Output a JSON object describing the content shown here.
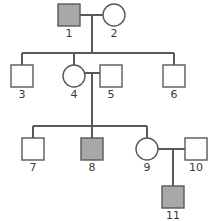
{
  "chart_data": {
    "type": "diagram",
    "diagram_kind": "pedigree-chart",
    "title": "",
    "generations": 3,
    "colors": {
      "stroke": "#595959",
      "affected_fill": "#a8a8a8",
      "unaffected_fill": "#ffffff",
      "background": "#ffffff",
      "label_color": "#3a3a3a"
    },
    "legend": {
      "square": "male",
      "circle": "female",
      "filled": "affected",
      "open": "unaffected"
    },
    "stroke_width": 1.4,
    "symbol_size": 22,
    "individuals": [
      {
        "id": "1",
        "label": "1",
        "sex": "male",
        "shape": "square",
        "affected": true,
        "generation": 1,
        "x": 69,
        "y": 15,
        "label_x": 69,
        "label_y": 37
      },
      {
        "id": "2",
        "label": "2",
        "sex": "female",
        "shape": "circle",
        "affected": false,
        "generation": 1,
        "x": 114,
        "y": 15,
        "label_x": 114,
        "label_y": 37
      },
      {
        "id": "3",
        "label": "3",
        "sex": "male",
        "shape": "square",
        "affected": false,
        "generation": 2,
        "x": 22,
        "y": 76,
        "label_x": 22,
        "label_y": 98
      },
      {
        "id": "4",
        "label": "4",
        "sex": "female",
        "shape": "circle",
        "affected": false,
        "generation": 2,
        "x": 74,
        "y": 76,
        "label_x": 74,
        "label_y": 98
      },
      {
        "id": "5",
        "label": "5",
        "sex": "male",
        "shape": "square",
        "affected": false,
        "generation": 2,
        "x": 111,
        "y": 76,
        "label_x": 111,
        "label_y": 98
      },
      {
        "id": "6",
        "label": "6",
        "sex": "male",
        "shape": "square",
        "affected": false,
        "generation": 2,
        "x": 174,
        "y": 76,
        "label_x": 174,
        "label_y": 98
      },
      {
        "id": "7",
        "label": "7",
        "sex": "male",
        "shape": "square",
        "affected": false,
        "generation": 3,
        "x": 33,
        "y": 149,
        "label_x": 33,
        "label_y": 171
      },
      {
        "id": "8",
        "label": "8",
        "sex": "male",
        "shape": "square",
        "affected": true,
        "generation": 3,
        "x": 92,
        "y": 149,
        "label_x": 92,
        "label_y": 171
      },
      {
        "id": "9",
        "label": "9",
        "sex": "female",
        "shape": "circle",
        "affected": false,
        "generation": 3,
        "x": 147,
        "y": 149,
        "label_x": 147,
        "label_y": 171
      },
      {
        "id": "10",
        "label": "10",
        "sex": "male",
        "shape": "square",
        "affected": false,
        "generation": 3,
        "x": 196,
        "y": 149,
        "label_x": 196,
        "label_y": 171
      },
      {
        "id": "11",
        "label": "11",
        "sex": "male",
        "shape": "square",
        "affected": true,
        "generation": 4,
        "x": 173,
        "y": 197,
        "label_x": 173,
        "label_y": 219
      }
    ],
    "matings": [
      {
        "id": "mating-1-2",
        "partners": [
          "1",
          "2"
        ],
        "line_y": 15,
        "x1": 80,
        "x2": 103,
        "drop_x": 92,
        "drop_from": 15,
        "drop_to": 53
      },
      {
        "id": "mating-4-5",
        "partners": [
          "4",
          "5"
        ],
        "line_y": 73,
        "x1": 85,
        "x2": 100,
        "drop_x": 92,
        "drop_to": 126,
        "drop_from": 73
      },
      {
        "id": "mating-9-10",
        "partners": [
          "9",
          "10"
        ],
        "line_y": 149,
        "x1": 158,
        "x2": 185,
        "drop_x": 173,
        "drop_from": 149,
        "drop_to": 186
      }
    ],
    "sibships": [
      {
        "id": "sibship-gen2",
        "parents": [
          "1",
          "2"
        ],
        "children": [
          "3",
          "4",
          "6"
        ],
        "bar_y": 53,
        "bar_x1": 22,
        "bar_x2": 174,
        "stubs": [
          {
            "child": "3",
            "x": 22,
            "y1": 53,
            "y2": 65
          },
          {
            "child": "4",
            "x": 74,
            "y1": 53,
            "y2": 65
          },
          {
            "child": "6",
            "x": 174,
            "y1": 53,
            "y2": 65
          }
        ]
      },
      {
        "id": "sibship-gen3",
        "parents": [
          "4",
          "5"
        ],
        "children": [
          "7",
          "8",
          "9"
        ],
        "bar_y": 126,
        "bar_x1": 33,
        "bar_x2": 147,
        "stubs": [
          {
            "child": "7",
            "x": 33,
            "y1": 126,
            "y2": 138
          },
          {
            "child": "8",
            "x": 92,
            "y1": 126,
            "y2": 138
          },
          {
            "child": "9",
            "x": 147,
            "y1": 126,
            "y2": 138
          }
        ]
      },
      {
        "id": "sibship-gen4",
        "parents": [
          "9",
          "10"
        ],
        "children": [
          "11"
        ],
        "bar_y": 186,
        "bar_x1": 173,
        "bar_x2": 173,
        "stubs": [
          {
            "child": "11",
            "x": 173,
            "y1": 168,
            "y2": 186
          }
        ]
      }
    ]
  }
}
